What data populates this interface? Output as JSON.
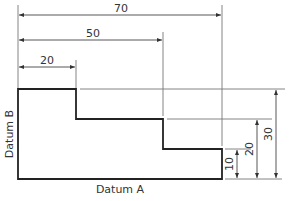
{
  "diagram": {
    "type": "datum dimensioning technical drawing",
    "colors": {
      "outline": "#222222",
      "dimension": "#555555",
      "text": "#333333",
      "background": "#ffffff"
    },
    "labels": {
      "datum_a": "Datum A",
      "datum_b": "Datum B"
    },
    "horizontal_dimensions": [
      {
        "label": "70",
        "value": 70
      },
      {
        "label": "50",
        "value": 50
      },
      {
        "label": "20",
        "value": 20
      }
    ],
    "vertical_dimensions": [
      {
        "label": "10",
        "value": 10
      },
      {
        "label": "20",
        "value": 20
      },
      {
        "label": "30",
        "value": 30
      }
    ]
  }
}
